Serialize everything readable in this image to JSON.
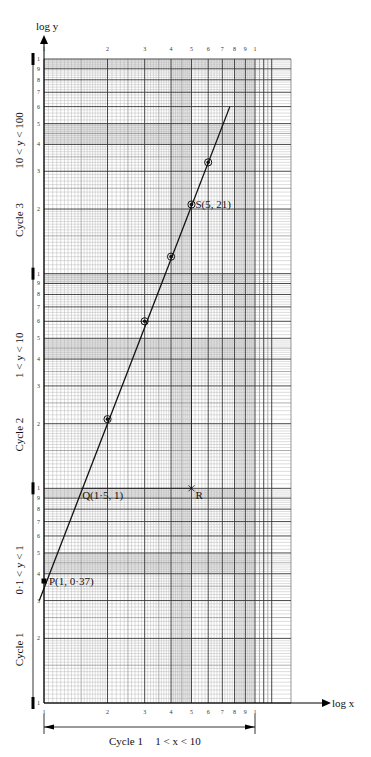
{
  "chart_data": {
    "type": "line",
    "title": "",
    "xlabel": "log x",
    "ylabel": "log y",
    "x_scale": "log",
    "y_scale": "log",
    "xlim": [
      1,
      10
    ],
    "x_grid_extends_to": 12,
    "ylim": [
      0.1,
      100
    ],
    "grid": true,
    "x_ticks": [
      {
        "value": 1,
        "label": "1"
      },
      {
        "value": 2,
        "label": "2"
      },
      {
        "value": 3,
        "label": "3"
      },
      {
        "value": 4,
        "label": "4"
      },
      {
        "value": 5,
        "label": "5"
      },
      {
        "value": 6,
        "label": "6"
      },
      {
        "value": 7,
        "label": "7"
      },
      {
        "value": 8,
        "label": "8"
      },
      {
        "value": 9,
        "label": "9"
      },
      {
        "value": 10,
        "label": "1"
      }
    ],
    "y_cycle_tick_labels": [
      "1",
      "2",
      "3",
      "4",
      "5",
      "6",
      "7",
      "8",
      "9",
      "1"
    ],
    "y_cycles": [
      {
        "name": "Cycle 1",
        "range_label": "0·1 < y < 1",
        "from": 0.1,
        "to": 1
      },
      {
        "name": "Cycle 2",
        "range_label": "1 < y < 10",
        "from": 1,
        "to": 10
      },
      {
        "name": "Cycle 3",
        "range_label": "10 < y < 100",
        "from": 10,
        "to": 100
      }
    ],
    "x_cycles": [
      {
        "name": "Cycle 1",
        "range_label": "1 < x < 10",
        "from": 1,
        "to": 10
      }
    ],
    "series": [
      {
        "name": "plotted points",
        "points": [
          {
            "x": 2,
            "y": 2.1
          },
          {
            "x": 3,
            "y": 6
          },
          {
            "x": 4,
            "y": 12
          },
          {
            "x": 5,
            "y": 21
          },
          {
            "x": 6,
            "y": 33
          }
        ]
      }
    ],
    "best_fit_line": {
      "from": {
        "x": 0.95,
        "y": 0.3
      },
      "to": {
        "x": 7.6,
        "y": 60
      }
    },
    "annotations": [
      {
        "id": "P",
        "label": "P(1, 0·37)",
        "x": 1,
        "y": 0.37
      },
      {
        "id": "Q",
        "label": "Q(1·5, 1)",
        "x": 1.5,
        "y": 1
      },
      {
        "id": "R",
        "label": "R",
        "x": 5,
        "y": 1
      },
      {
        "id": "S",
        "label": "S(5, 21)",
        "x": 5,
        "y": 21
      }
    ],
    "construction_lines": [
      {
        "from": "Q",
        "to": "R"
      },
      {
        "from": "S",
        "to": "R"
      }
    ]
  }
}
